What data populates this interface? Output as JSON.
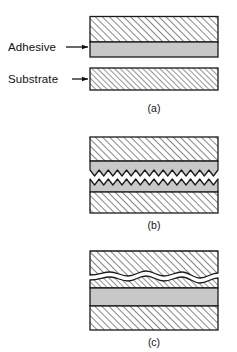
{
  "figure": {
    "background_color": "#ffffff",
    "outline_color": "#1a1a1a",
    "adhesive_fill": "#c8c8c8",
    "substrate_fill": "#ffffff",
    "hatch_color": "#2b2b2b",
    "crack_fill": "#ffffff"
  },
  "labels": {
    "adhesive": "Adhesive",
    "substrate": "Substrate"
  },
  "panels": [
    {
      "id": "a",
      "caption": "(a)",
      "failure_mode": "adhesive failure",
      "layers": [
        {
          "name": "upper-substrate",
          "material": "substrate",
          "fill": "hatch"
        },
        {
          "name": "upper-adhesive",
          "material": "adhesive",
          "fill": "grey"
        },
        {
          "name": "lower-substrate",
          "material": "substrate",
          "fill": "hatch"
        }
      ]
    },
    {
      "id": "b",
      "caption": "(b)",
      "failure_mode": "cohesive failure",
      "crack_type": "zigzag",
      "crack_teeth": 14,
      "layers": [
        {
          "name": "upper-substrate",
          "material": "substrate",
          "fill": "hatch"
        },
        {
          "name": "upper-adhesive",
          "material": "adhesive",
          "fill": "grey"
        },
        {
          "name": "lower-adhesive",
          "material": "adhesive",
          "fill": "grey"
        },
        {
          "name": "lower-substrate",
          "material": "substrate",
          "fill": "hatch"
        }
      ]
    },
    {
      "id": "c",
      "caption": "(c)",
      "failure_mode": "substrate failure",
      "crack_type": "wavy",
      "layers": [
        {
          "name": "upper-substrate-top",
          "material": "substrate",
          "fill": "hatch"
        },
        {
          "name": "upper-substrate-bottom",
          "material": "substrate",
          "fill": "hatch"
        },
        {
          "name": "adhesive",
          "material": "adhesive",
          "fill": "grey"
        },
        {
          "name": "lower-substrate",
          "material": "substrate",
          "fill": "hatch"
        }
      ]
    }
  ],
  "geometry": {
    "block_left": 90,
    "block_right": 218,
    "label_arrow_adhesive_y": 47,
    "label_arrow_substrate_y": 79
  }
}
